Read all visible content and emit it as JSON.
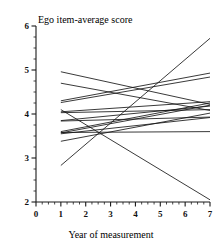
{
  "chart_data": {
    "type": "line",
    "title": "Ego item-average score",
    "xlabel": "Year of measurement",
    "ylabel": "",
    "xlim": [
      0,
      7
    ],
    "ylim": [
      2,
      6
    ],
    "xticks": [
      0,
      1,
      2,
      3,
      4,
      5,
      6,
      7
    ],
    "xtick_labels": [
      "0",
      "1",
      "2",
      "3",
      "4",
      "5",
      "6",
      "7"
    ],
    "yticks": [
      2,
      3,
      4,
      5,
      6
    ],
    "ytick_labels": [
      "2",
      "3",
      "4",
      "5",
      "6"
    ],
    "x_minor_step": 0.25,
    "y_minor_step": 0.25,
    "grid": false,
    "legend": "none",
    "annotations": [],
    "x": [
      1,
      7
    ],
    "series": [
      {
        "name": "case-1",
        "values": [
          2.83,
          5.72
        ]
      },
      {
        "name": "case-2",
        "values": [
          4.96,
          4.22
        ]
      },
      {
        "name": "case-3",
        "values": [
          4.3,
          4.93
        ]
      },
      {
        "name": "case-4",
        "values": [
          4.26,
          4.84
        ]
      },
      {
        "name": "case-5",
        "values": [
          4.05,
          4.28
        ]
      },
      {
        "name": "case-6",
        "values": [
          4.03,
          4.1
        ]
      },
      {
        "name": "case-7",
        "values": [
          3.85,
          4.18
        ]
      },
      {
        "name": "case-8",
        "values": [
          3.84,
          3.93
        ]
      },
      {
        "name": "case-9",
        "values": [
          3.6,
          4.25
        ]
      },
      {
        "name": "case-10",
        "values": [
          3.58,
          3.6
        ]
      },
      {
        "name": "case-11",
        "values": [
          3.57,
          4.2
        ]
      },
      {
        "name": "case-12",
        "values": [
          3.55,
          3.92
        ]
      },
      {
        "name": "case-13",
        "values": [
          3.38,
          4.02
        ]
      },
      {
        "name": "case-14",
        "values": [
          4.1,
          2.05
        ]
      },
      {
        "name": "case-15",
        "values": [
          4.7,
          4.08
        ]
      }
    ]
  }
}
